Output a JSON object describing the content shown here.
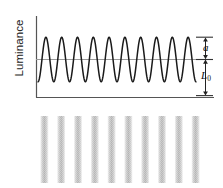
{
  "figure": {
    "kind": "luminance-grating-profile",
    "axis": {
      "y_label": "Luminance",
      "x_label": "",
      "y_axis_x": 36,
      "x_axis_y": 97,
      "plot_left": 36,
      "plot_right": 196,
      "plot_top": 16,
      "plot_bottom": 97
    },
    "annotations": {
      "amplitude_label": "a",
      "mean_label": "L",
      "mean_subscript": "0"
    },
    "colors": {
      "wave_stroke": "#1a1a1a",
      "axis_stroke": "#555555",
      "midline_stroke": "#9a9a9a",
      "tick_stroke": "#333333",
      "grating_bar": "#c9c9c9",
      "background": "#ffffff"
    }
  },
  "chart_data": {
    "type": "line",
    "title": "",
    "xlabel": "",
    "ylabel": "Luminance",
    "grid": false,
    "legend": "none",
    "waveform": {
      "shape": "sinusoid",
      "cycles": 10,
      "mean_level": 0.5,
      "amplitude": 0.5,
      "phase_deg": -90,
      "mean_luminance_symbol": "L0",
      "amplitude_symbol": "a"
    },
    "reference_lines": [
      {
        "name": "mean-luminance-line",
        "orientation": "horizontal",
        "value": 0.5
      }
    ],
    "tick_marks": [
      {
        "name": "peak-tick",
        "value": 1.0
      },
      {
        "name": "mean-tick",
        "value": 0.5
      },
      {
        "name": "zero-tick",
        "value": 0.0
      }
    ],
    "arrows": [
      {
        "name": "amplitude-arrow",
        "from": 1.0,
        "to": 0.5,
        "label": "a"
      },
      {
        "name": "mean-luminance-arrow",
        "from": 0.5,
        "to": 0.0,
        "label": "L0"
      }
    ],
    "grating": {
      "type": "sinusoidal-grating-image",
      "bars": 10,
      "orientation": "vertical",
      "texture": "halftone-dither"
    }
  }
}
